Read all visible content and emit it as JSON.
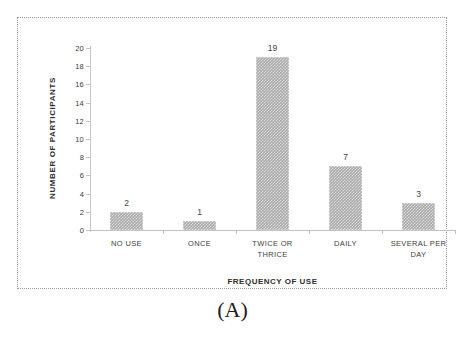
{
  "panel": {
    "caption": "(A)"
  },
  "chart_data": {
    "type": "bar",
    "title": "",
    "xlabel": "FREQUENCY OF USE",
    "ylabel": "NUMBER OF PARTICIPANTS",
    "categories": [
      "NO USE",
      "ONCE",
      "TWICE OR\nTHRICE",
      "DAILY",
      "SEVERAL PER\nDAY"
    ],
    "values": [
      2,
      1,
      19,
      7,
      3
    ],
    "data_labels": [
      "2",
      "1",
      "19",
      "7",
      "3"
    ],
    "ylim": [
      0,
      20
    ],
    "ytick_step": 2,
    "yticks": [
      "20",
      "18",
      "16",
      "14",
      "12",
      "10",
      "8",
      "6",
      "4",
      "2",
      "0"
    ],
    "grid": false,
    "legend": "none",
    "bar_color": "#a8a8a8",
    "bar_pattern": "checkered",
    "axis_color": "#c2c2c2",
    "frame_color": "#9b9b9b",
    "background": "#ffffff"
  }
}
